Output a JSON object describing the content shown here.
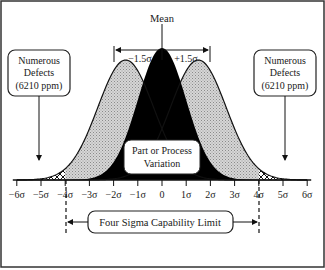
{
  "mean_label": "Mean",
  "shift_left_label": "−1.5σ",
  "shift_right_label": "+1.5σ",
  "left_callout": {
    "line1": "Numerous",
    "line2": "Defects",
    "line3": "(6210 ppm)"
  },
  "right_callout": {
    "line1": "Numerous",
    "line2": "Defects",
    "line3": "(6210 ppm)"
  },
  "center_label": {
    "line1": "Part or Process",
    "line2": "Variation"
  },
  "limit_label": "Four Sigma Capability Limit",
  "axis": {
    "ticks": [
      "−6σ",
      "−5σ",
      "−4σ",
      "−3σ",
      "−2σ",
      "−1σ",
      "0",
      "1σ",
      "2σ",
      "3σ",
      "4σ",
      "5σ",
      "6σ"
    ],
    "tick_values": [
      -6,
      -5,
      -4,
      -3,
      -2,
      -1,
      0,
      1,
      2,
      3,
      4,
      5,
      6
    ]
  },
  "distributions": {
    "center_mean": 0,
    "shift": 1.5,
    "spec_limits": [
      -4,
      4
    ]
  },
  "colors": {
    "center_fill": "#000000",
    "shifted_fill": "#c8c8c8",
    "defect_hatch": "#000000",
    "border": "#333333"
  }
}
